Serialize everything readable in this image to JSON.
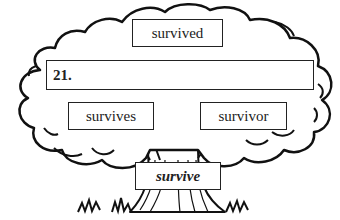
{
  "diagram": {
    "type": "word-family-tree",
    "top_word": "survived",
    "answer_bar": {
      "label": "21.",
      "value": ""
    },
    "left_word": "survives",
    "right_word": "survivor",
    "root_word": "survive"
  }
}
